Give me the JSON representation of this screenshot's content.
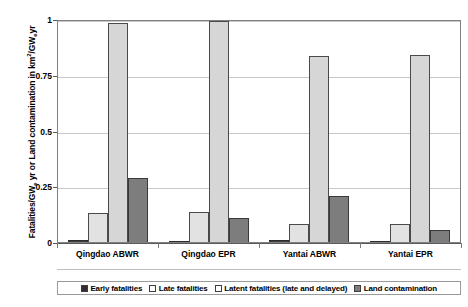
{
  "chart_data": {
    "type": "bar",
    "title": "",
    "xlabel": "",
    "ylabel": "Fatalities/GWe yr or Land contamination in km2/GWe yr",
    "ylim": [
      0,
      1
    ],
    "yticks": [
      0,
      0.25,
      0.5,
      0.75,
      1
    ],
    "ytick_labels": [
      "0",
      "0.25",
      "0.5",
      "0.75",
      "1"
    ],
    "grid": true,
    "legend_position": "bottom",
    "categories": [
      "Qingdao ABWR",
      "Qingdao EPR",
      "Yantai ABWR",
      "Yantai EPR"
    ],
    "series": [
      {
        "name": "Early fatalities",
        "values": [
          0.008,
          0.006,
          0.008,
          0.006
        ],
        "color": "#2f2f2f"
      },
      {
        "name": "Late fatalities",
        "values": [
          0.13,
          0.135,
          0.08,
          0.08
        ],
        "color": "#e2e2e2"
      },
      {
        "name": "Latent fatalities (late and delayed)",
        "values": [
          0.99,
          1.0,
          0.84,
          0.845
        ],
        "color": "#d6d6d6"
      },
      {
        "name": "Land contamination",
        "values": [
          0.29,
          0.11,
          0.21,
          0.055
        ],
        "color": "#7d7d7d"
      }
    ]
  },
  "axis": {
    "y_title_main": "Fatalities/GW",
    "y_title_sub1": "e",
    "y_title_mid": "yr or Land contamination in km",
    "y_title_sup": "2",
    "y_title_mid2": "/GW",
    "y_title_sub2": "e",
    "y_title_end": "yr"
  }
}
